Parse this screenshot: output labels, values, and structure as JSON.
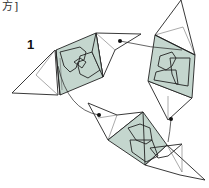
{
  "header": {
    "text_fragment": "方]"
  },
  "step": {
    "number": "1"
  },
  "diagram": {
    "modules": [
      {
        "name": "module-upper-left",
        "shading": "pale green-gray"
      },
      {
        "name": "module-right",
        "shading": "pale green-gray"
      },
      {
        "name": "module-bottom",
        "shading": "pale green-gray"
      }
    ],
    "connectors": 3,
    "colors": {
      "shade": "#c4d6ce",
      "line": "#222222",
      "paper": "#ffffff"
    }
  }
}
